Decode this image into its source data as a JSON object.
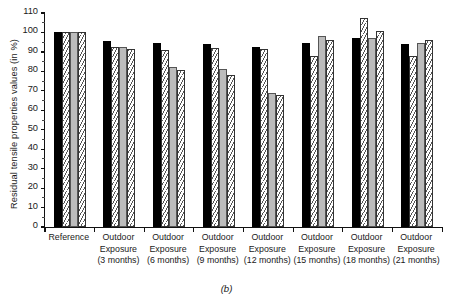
{
  "figure": {
    "caption": "(b)",
    "ylabel": "Residual tensile properties values (in %)"
  },
  "chart_data": {
    "type": "bar",
    "title": "",
    "xlabel": "",
    "ylabel": "Residual tensile properties values (in %)",
    "ylim": [
      0,
      110
    ],
    "ytick_step": 10,
    "yticks": [
      0,
      10,
      20,
      30,
      40,
      50,
      60,
      70,
      80,
      90,
      100,
      110
    ],
    "grid": false,
    "legend": "none",
    "bar_styles": [
      "solid-black",
      "hatch",
      "solid-gray",
      "hatch"
    ],
    "categories": [
      "Reference",
      "Outdoor Exposure (3 months)",
      "Outdoor Exposure (6 months)",
      "Outdoor Exposure (9 months)",
      "Outdoor Exposure (12 months)",
      "Outdoor Exposure (15 months)",
      "Outdoor Exposure (18 months)",
      "Outdoor Exposure (21 months)"
    ],
    "category_lines": [
      [
        "Reference"
      ],
      [
        "Outdoor",
        "Exposure",
        "(3 months)"
      ],
      [
        "Outdoor",
        "Exposure",
        "(6 months)"
      ],
      [
        "Outdoor",
        "Exposure",
        "(9 months)"
      ],
      [
        "Outdoor",
        "Exposure",
        "(12 months)"
      ],
      [
        "Outdoor",
        "Exposure",
        "(15 months)"
      ],
      [
        "Outdoor",
        "Exposure",
        "(18 months)"
      ],
      [
        "Outdoor",
        "Exposure",
        "(21 months)"
      ]
    ],
    "series": [
      {
        "name": "Property 1",
        "style": "solid-black",
        "values": [
          100,
          95.5,
          94.5,
          94,
          92.5,
          94.5,
          97,
          94
        ]
      },
      {
        "name": "Property 2",
        "style": "hatch",
        "values": [
          100,
          92.5,
          91,
          92,
          91.5,
          88,
          107.5,
          88
        ]
      },
      {
        "name": "Property 3",
        "style": "solid-gray",
        "values": [
          100,
          92.5,
          82,
          81,
          69,
          98,
          97,
          94.5
        ]
      },
      {
        "name": "Property 4",
        "style": "hatch",
        "values": [
          100,
          91.5,
          80.5,
          78,
          68,
          96,
          100.5,
          96
        ]
      }
    ]
  }
}
